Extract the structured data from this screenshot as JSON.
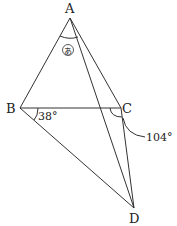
{
  "diagram": {
    "type": "geometry",
    "points": {
      "A": {
        "label": "A",
        "x": 70,
        "y": 18
      },
      "B": {
        "label": "B",
        "x": 20,
        "y": 108
      },
      "C": {
        "label": "C",
        "x": 121,
        "y": 108
      },
      "D": {
        "label": "D",
        "x": 134,
        "y": 208
      }
    },
    "segments": [
      "AB",
      "AC",
      "AD",
      "BC",
      "BD",
      "CD"
    ],
    "angles": {
      "unknown": {
        "label": "あ",
        "vertex": "A",
        "between": [
          "AB",
          "AC"
        ]
      },
      "angle_CBD": {
        "label": "38°",
        "vertex": "B"
      },
      "angle_BCD": {
        "label": "104°",
        "vertex": "C"
      }
    }
  }
}
